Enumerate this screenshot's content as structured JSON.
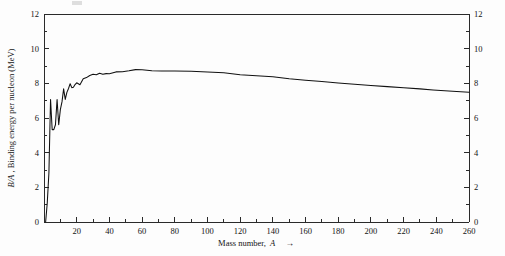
{
  "chart_data": {
    "type": "line",
    "title": "",
    "xlabel": "Mass number, A",
    "xlabel_arrow": "→",
    "ylabel": "B/A, Binding energy per nucleon (MeV)",
    "ylabel_italic_prefix": "B/A",
    "ylabel_rest": ", Binding energy per nucleon (MeV)",
    "xlim": [
      0,
      260
    ],
    "ylim": [
      0,
      12
    ],
    "xticks": [
      0,
      20,
      40,
      60,
      80,
      100,
      120,
      140,
      160,
      180,
      200,
      220,
      240,
      260
    ],
    "xticklabels": [
      "",
      "20",
      "40",
      "60",
      "80",
      "100",
      "120",
      "140",
      "160",
      "180",
      "200",
      "220",
      "240",
      "260"
    ],
    "xminorticks": [
      10,
      30,
      50,
      70,
      90,
      110,
      130,
      150,
      170,
      190,
      210,
      230,
      250
    ],
    "yticks": [
      0,
      2,
      4,
      6,
      8,
      10,
      12
    ],
    "yticklabels": [
      "0",
      "2",
      "4",
      "6",
      "8",
      "10",
      "12"
    ],
    "yminorticks": [
      1,
      3,
      5,
      7,
      9,
      11
    ],
    "right_axis_ticks": [
      0,
      2,
      4,
      6,
      8,
      10,
      12
    ],
    "right_axis_ticklabels": [
      "0",
      "2",
      "4",
      "6",
      "8",
      "10",
      "12"
    ],
    "grid": false,
    "legend": false,
    "line_color": "#111111",
    "axis_color": "#2a2a2a",
    "series": [
      {
        "name": "Binding energy per nucleon",
        "x": [
          1,
          2,
          3,
          4,
          5,
          6,
          7,
          8,
          9,
          10,
          11,
          12,
          13,
          14,
          15,
          16,
          17,
          18,
          19,
          20,
          22,
          24,
          26,
          28,
          30,
          32,
          34,
          36,
          38,
          40,
          44,
          48,
          52,
          56,
          60,
          66,
          72,
          80,
          90,
          100,
          110,
          120,
          130,
          140,
          150,
          160,
          170,
          180,
          190,
          200,
          210,
          220,
          230,
          238,
          250,
          260
        ],
        "values": [
          0.0,
          1.11,
          2.83,
          7.07,
          5.33,
          5.33,
          5.61,
          7.06,
          5.61,
          6.48,
          6.93,
          7.68,
          7.07,
          7.48,
          7.7,
          7.98,
          7.75,
          7.77,
          7.93,
          8.03,
          7.92,
          8.26,
          8.33,
          8.45,
          8.52,
          8.49,
          8.58,
          8.52,
          8.56,
          8.55,
          8.66,
          8.67,
          8.72,
          8.79,
          8.78,
          8.73,
          8.71,
          8.71,
          8.7,
          8.65,
          8.61,
          8.5,
          8.44,
          8.38,
          8.26,
          8.18,
          8.11,
          8.02,
          7.95,
          7.87,
          7.81,
          7.75,
          7.68,
          7.62,
          7.54,
          7.48
        ],
        "description": "Nuclear binding energy per nucleon versus mass number; sharp peaks at A=4 (He-4), A=12 (C-12), A=16 (O-16), broad maximum near A=56 (Fe-56) at about 8.8 MeV, slow decline to about 7.5 MeV at A=260"
      }
    ],
    "annotations": [
      {
        "label": "peak near A=56 (Fe), about 8.8 MeV",
        "x": 56,
        "y": 8.79
      },
      {
        "label": "He-4 spike, about 7.07 MeV",
        "x": 4,
        "y": 7.07
      }
    ]
  },
  "figure": {
    "background": "#fdfdfd",
    "plot_area": {
      "left": 44,
      "top": 14,
      "right": 469,
      "bottom": 222
    }
  }
}
